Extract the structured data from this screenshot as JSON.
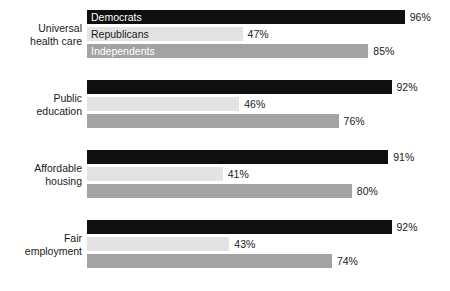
{
  "chart_data": {
    "type": "bar",
    "orientation": "horizontal",
    "title": "",
    "subtitle": "",
    "xlabel": "",
    "ylabel": "",
    "xlim": [
      0,
      100
    ],
    "grid": false,
    "legend_position": "in-bars-first-group",
    "value_suffix": "%",
    "categories": [
      "Universal\nhealth care",
      "Public\neducation",
      "Affordable\nhousing",
      "Fair\nemployment"
    ],
    "series": [
      {
        "name": "Democrats",
        "color": "#100f0f",
        "label_color": "#ffffff",
        "values": [
          96,
          92,
          91,
          92
        ],
        "value_labels": [
          "96%",
          "92%",
          "91%",
          "92%"
        ]
      },
      {
        "name": "Republicans",
        "color": "#e3e3e3",
        "label_color": "#1a1a1a",
        "values": [
          47,
          46,
          41,
          43
        ],
        "value_labels": [
          "47%",
          "46%",
          "41%",
          "43%"
        ]
      },
      {
        "name": "Independents",
        "color": "#a3a3a3",
        "label_color": "#ffffff",
        "values": [
          85,
          76,
          80,
          74
        ],
        "value_labels": [
          "85%",
          "76%",
          "80%",
          "74%"
        ]
      }
    ]
  },
  "layout": {
    "plot_left_px": 87,
    "px_per_percent": 3.31,
    "group_tops_px": [
      10,
      80,
      150,
      220
    ],
    "bar_height_px": 14,
    "bar_gap_px": 3,
    "value_gap_px": 5
  }
}
